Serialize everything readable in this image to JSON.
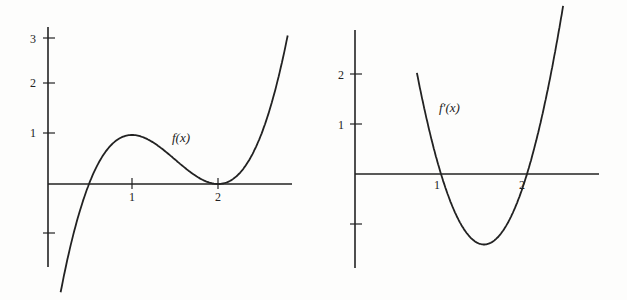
{
  "chart_data": [
    {
      "type": "line",
      "title": "",
      "label": "f(x)",
      "xlabel": "",
      "ylabel": "",
      "xticks": [
        "1",
        "2"
      ],
      "yticks": [
        "3",
        "2",
        "1",
        ""
      ],
      "xlim": [
        0,
        2.85
      ],
      "ylim": [
        -1.7,
        3.1
      ],
      "grid": false,
      "x": [
        0.17,
        0.5,
        1.0,
        1.5,
        2.0,
        2.5,
        2.8
      ],
      "values": [
        -2.0,
        0.0,
        1.0,
        0.5,
        0.0,
        1.0,
        2.94
      ],
      "annotations": [
        "local max at (1,1)",
        "local min at (2,0)"
      ]
    },
    {
      "type": "line",
      "title": "",
      "label": "f'(x)",
      "xlabel": "",
      "ylabel": "",
      "xticks": [
        "1",
        "2"
      ],
      "yticks": [
        "2",
        "1",
        ""
      ],
      "xlim": [
        0,
        2.85
      ],
      "ylim": [
        -1.9,
        2.9
      ],
      "grid": false,
      "x": [
        0.75,
        1.0,
        1.5,
        2.0,
        2.4
      ],
      "values": [
        3.0,
        0.0,
        -1.5,
        0.0,
        3.0
      ],
      "annotations": [
        "roots at x=1 and x=2",
        "minimum at x=1.5"
      ]
    }
  ],
  "labels": {
    "left": {
      "func": "f(x)",
      "x1": "1",
      "x2": "2",
      "y1": "1",
      "y2": "2",
      "y3": "3"
    },
    "right": {
      "func": "f′(x)",
      "x1": "1",
      "x2": "2",
      "y1": "1",
      "y2": "2"
    }
  }
}
